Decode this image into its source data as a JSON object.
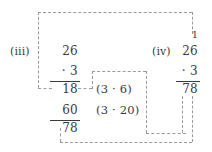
{
  "figure": {
    "type": "arithmetic-worked-example"
  },
  "problem_three": {
    "label": "(iii)",
    "multiplicand": "26",
    "multiplier": "· 3",
    "partial_product_ones": "18",
    "partial_product_tens": "60",
    "total": "78"
  },
  "annotations": {
    "ones": "(3 · 6)",
    "tens": "(3 · 20)"
  },
  "problem_four": {
    "label": "(iv)",
    "carry": "1",
    "multiplicand": "26",
    "multiplier": "· 3",
    "total": "78"
  },
  "colors": {
    "text": "#3a3a3a",
    "rule": "#3a3a3a",
    "dash": "#9a9a9a",
    "background": "#ffffff"
  }
}
